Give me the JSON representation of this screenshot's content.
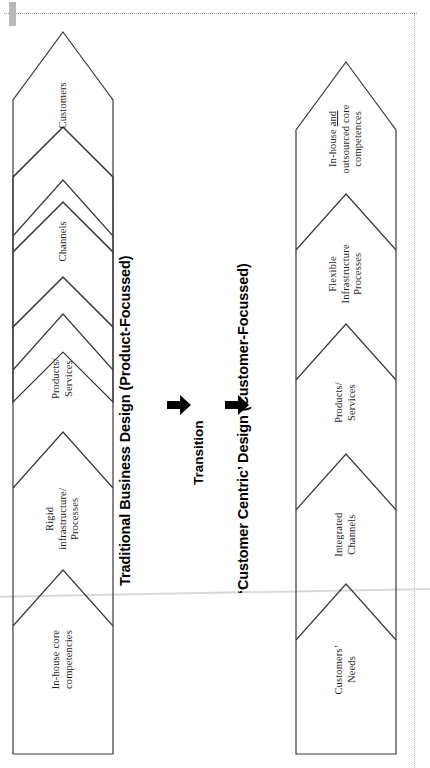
{
  "diagram": {
    "title_traditional": "Traditional Business Design  (Product-Focussed)",
    "title_customer": "‘Customer Centric’ Design (Customer-Focussed)",
    "transition_label": "Transition",
    "arrow_icon_name": "right-arrow-icon",
    "columns": [
      {
        "id": "traditional",
        "heading": "Traditional Business Design  (Product-Focussed)",
        "segments": [
          {
            "lines": [
              "Customers"
            ]
          },
          {
            "lines": [
              "Channels"
            ]
          },
          {
            "lines": [
              "Products/",
              "Services"
            ]
          },
          {
            "lines": [
              "Rigid",
              "infrastructure/",
              "Processes"
            ]
          },
          {
            "lines": [
              "In-house core",
              "competencies"
            ]
          }
        ]
      },
      {
        "id": "customer-centric",
        "heading": "‘Customer Centric’ Design (Customer-Focussed)",
        "segments": [
          {
            "lines": [
              "In-house and",
              "outsourced core",
              "competences"
            ],
            "underline_word": "and"
          },
          {
            "lines": [
              "Flexible",
              "Infrastructure",
              "Processes"
            ]
          },
          {
            "lines": [
              "Products/",
              "Services"
            ]
          },
          {
            "lines": [
              "Integrated",
              "Channels"
            ]
          },
          {
            "lines": [
              "Customers’",
              "Needs"
            ]
          }
        ]
      }
    ],
    "colors": {
      "outline": "#3a3a3a",
      "text": "#1d1d1d",
      "heading": "#000000",
      "arrow": "#000000",
      "scan_artifact": "#bdbdbd"
    }
  }
}
